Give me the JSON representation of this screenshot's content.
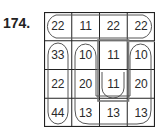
{
  "problem": {
    "number": "174."
  },
  "grid": {
    "rows": 4,
    "cols": 4,
    "cells": [
      [
        "22",
        "11",
        "22",
        "22"
      ],
      [
        "33",
        "10",
        "11",
        "10"
      ],
      [
        "22",
        "20",
        "11",
        "20"
      ],
      [
        "44",
        "13",
        "13",
        "13"
      ]
    ]
  },
  "groupings": [
    {
      "shape": "loop",
      "cells": [
        [
          0,
          0
        ],
        [
          0,
          1
        ],
        [
          0,
          2
        ],
        [
          0,
          3
        ]
      ],
      "description": "top row horizontal loop"
    },
    {
      "shape": "loop",
      "cells": [
        [
          1,
          0
        ],
        [
          2,
          0
        ],
        [
          3,
          0
        ]
      ],
      "description": "left column vertical loop"
    },
    {
      "shape": "u-loop",
      "cells": [
        [
          1,
          1
        ],
        [
          2,
          1
        ],
        [
          3,
          1
        ],
        [
          3,
          2
        ],
        [
          3,
          3
        ],
        [
          2,
          3
        ],
        [
          1,
          3
        ]
      ],
      "description": "large U-shaped loop"
    },
    {
      "shape": "loop-with-box",
      "cells": [
        [
          1,
          2
        ],
        [
          2,
          2
        ]
      ],
      "description": "center column loop with grey rectangle"
    }
  ],
  "colors": {
    "grid_line": "#222222",
    "loop_line": "#555555",
    "box_line": "#777777"
  }
}
